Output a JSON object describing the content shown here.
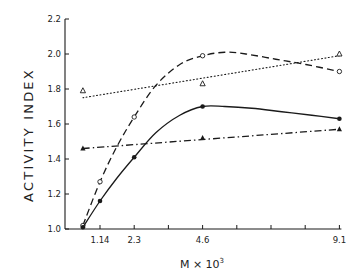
{
  "chart_data": {
    "type": "line",
    "title": "",
    "xlabel": "M × 10³",
    "xlabel_base": "M × 10",
    "xlabel_exp": "3",
    "ylabel": "ACTIVITY INDEX",
    "xlim": [
      0.3,
      9.3
    ],
    "ylim": [
      1.0,
      2.2
    ],
    "x_ticks": [
      1.14,
      2.28,
      3.42,
      4.56,
      5.7,
      6.84,
      7.98,
      9.12
    ],
    "x_tick_labels": [
      "1.14",
      "2.3",
      "",
      "4.6",
      "",
      "",
      "",
      "9.1"
    ],
    "y_ticks": [
      1.0,
      1.2,
      1.4,
      1.6,
      1.8,
      2.0,
      2.2
    ],
    "y_tick_labels": [
      "1.0",
      "1.2",
      "1.4",
      "1.6",
      "1.8",
      "2.0",
      "2.2"
    ],
    "grid": false,
    "legend": null,
    "series": [
      {
        "name": "open circles (dashed curve)",
        "marker": "open-circle",
        "line": "dashed",
        "x": [
          0.57,
          1.14,
          2.28,
          4.56,
          9.12
        ],
        "y": [
          1.02,
          1.27,
          1.64,
          1.99,
          1.9
        ],
        "curve": [
          [
            0.57,
            1.02
          ],
          [
            1.14,
            1.27
          ],
          [
            1.7,
            1.47
          ],
          [
            2.28,
            1.64
          ],
          [
            3.0,
            1.82
          ],
          [
            3.8,
            1.94
          ],
          [
            4.56,
            1.99
          ],
          [
            5.3,
            2.01
          ],
          [
            6.0,
            2.0
          ],
          [
            7.0,
            1.97
          ],
          [
            8.0,
            1.94
          ],
          [
            9.12,
            1.9
          ]
        ]
      },
      {
        "name": "filled circles (solid curve)",
        "marker": "filled-circle",
        "line": "solid",
        "x": [
          0.57,
          1.14,
          2.28,
          4.56,
          9.12
        ],
        "y": [
          1.01,
          1.16,
          1.41,
          1.7,
          1.63
        ],
        "curve": [
          [
            0.57,
            1.01
          ],
          [
            1.14,
            1.16
          ],
          [
            1.7,
            1.29
          ],
          [
            2.28,
            1.41
          ],
          [
            3.0,
            1.55
          ],
          [
            3.8,
            1.65
          ],
          [
            4.56,
            1.7
          ],
          [
            5.3,
            1.7
          ],
          [
            6.2,
            1.69
          ],
          [
            7.2,
            1.67
          ],
          [
            8.2,
            1.65
          ],
          [
            9.12,
            1.63
          ]
        ]
      },
      {
        "name": "open triangles (dotted line)",
        "marker": "open-triangle",
        "line": "dotted",
        "x": [
          0.57,
          4.56,
          9.12
        ],
        "y": [
          1.79,
          1.83,
          2.0
        ],
        "fit_line": [
          [
            0.57,
            1.75
          ],
          [
            9.12,
            1.99
          ]
        ]
      },
      {
        "name": "filled triangles (dash-dot line)",
        "marker": "filled-triangle",
        "line": "dash-dot",
        "x": [
          0.57,
          4.56,
          9.12
        ],
        "y": [
          1.46,
          1.52,
          1.57
        ],
        "fit_line": [
          [
            0.57,
            1.46
          ],
          [
            9.12,
            1.57
          ]
        ]
      }
    ]
  },
  "colors": {
    "ink": "#1a1a1a",
    "background": "#ffffff"
  }
}
